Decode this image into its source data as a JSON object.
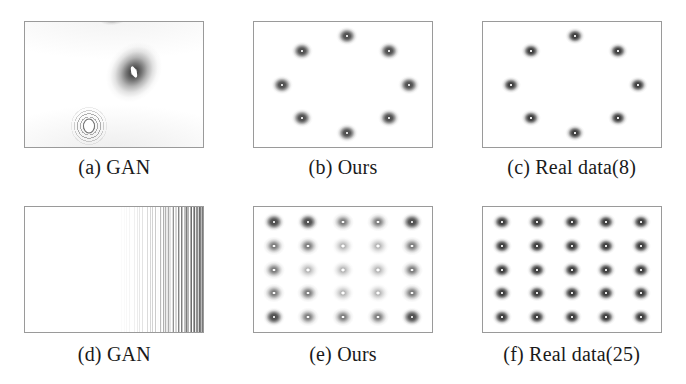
{
  "figure": {
    "type": "subfigure-grid",
    "columns": 3,
    "rows": 2,
    "panels": [
      {
        "id": "a",
        "caption": "(a) GAN",
        "kind": "density-blobs",
        "mode_count": 3,
        "description": "collapsed GAN density with three diffuse blobs",
        "modes": [
          {
            "x": 50,
            "y": -3,
            "style": "blob-top"
          },
          {
            "x": 61,
            "y": 40,
            "style": "blob-main"
          },
          {
            "x": 36,
            "y": 83,
            "style": "blob-rings"
          }
        ]
      },
      {
        "id": "b",
        "caption": "(b) Ours",
        "kind": "ring-8",
        "mode_count": 8,
        "description": "eight recovered modes arranged in a ring",
        "modes": [
          {
            "x": 52,
            "y": 11,
            "style": "soft"
          },
          {
            "x": 76,
            "y": 23,
            "style": "soft"
          },
          {
            "x": 87,
            "y": 50,
            "style": "soft"
          },
          {
            "x": 76,
            "y": 77,
            "style": "soft"
          },
          {
            "x": 52,
            "y": 89,
            "style": "soft"
          },
          {
            "x": 27,
            "y": 77,
            "style": "soft"
          },
          {
            "x": 16,
            "y": 50,
            "style": "soft"
          },
          {
            "x": 27,
            "y": 23,
            "style": "soft"
          }
        ]
      },
      {
        "id": "c",
        "caption": "(c) Real data(8)",
        "kind": "ring-8",
        "mode_count": 8,
        "description": "ground-truth eight-mode ring",
        "modes": [
          {
            "x": 52,
            "y": 11,
            "style": "crisp"
          },
          {
            "x": 76,
            "y": 23,
            "style": "crisp"
          },
          {
            "x": 87,
            "y": 50,
            "style": "crisp"
          },
          {
            "x": 76,
            "y": 77,
            "style": "crisp"
          },
          {
            "x": 52,
            "y": 89,
            "style": "crisp"
          },
          {
            "x": 27,
            "y": 77,
            "style": "crisp"
          },
          {
            "x": 16,
            "y": 50,
            "style": "crisp"
          },
          {
            "x": 27,
            "y": 23,
            "style": "crisp"
          }
        ]
      },
      {
        "id": "d",
        "caption": "(d) GAN",
        "kind": "collapsed-stripes",
        "mode_count": 0,
        "description": "fully collapsed GAN, fine vertical contour striations crowded at the right edge",
        "modes": []
      },
      {
        "id": "e",
        "caption": "(e) Ours",
        "kind": "grid-25",
        "mode_count": 25,
        "description": "twenty-five recovered modes on a five-by-five grid, interior modes fainter",
        "grid": {
          "cols": 5,
          "rows": 5
        },
        "styles": [
          [
            "soft",
            "soft",
            "mid",
            "mid",
            "soft"
          ],
          [
            "mid",
            "mid",
            "faint",
            "faint",
            "mid"
          ],
          [
            "mid",
            "faint",
            "faint",
            "faint",
            "mid"
          ],
          [
            "mid",
            "mid",
            "faint",
            "faint",
            "mid"
          ],
          [
            "soft",
            "mid",
            "mid",
            "mid",
            "soft"
          ]
        ]
      },
      {
        "id": "f",
        "caption": "(f) Real data(25)",
        "kind": "grid-25",
        "mode_count": 25,
        "description": "ground-truth twenty-five-mode grid",
        "grid": {
          "cols": 5,
          "rows": 5
        },
        "styles": [
          [
            "crisp",
            "crisp",
            "crisp",
            "crisp",
            "crisp"
          ],
          [
            "crisp",
            "crisp",
            "crisp",
            "crisp",
            "crisp"
          ],
          [
            "crisp",
            "crisp",
            "crisp",
            "crisp",
            "crisp"
          ],
          [
            "crisp",
            "crisp",
            "crisp",
            "crisp",
            "crisp"
          ],
          [
            "crisp",
            "crisp",
            "crisp",
            "crisp",
            "crisp"
          ]
        ]
      }
    ]
  },
  "colors": {
    "background": "#ffffff",
    "panel_border": "#9a9a9a",
    "mode_dark": "#3a3a3a",
    "caption_text": "#1a1a1a"
  },
  "chart_data": {
    "type": "scatter",
    "title": "",
    "xlabel": "",
    "ylabel": "",
    "grid": false,
    "legend": "none",
    "panels": [
      {
        "id": "a",
        "label": "(a) GAN",
        "modes_shown": 3,
        "modes_expected": 8
      },
      {
        "id": "b",
        "label": "(b) Ours",
        "modes_shown": 8,
        "modes_expected": 8
      },
      {
        "id": "c",
        "label": "(c) Real data(8)",
        "modes_shown": 8,
        "modes_expected": 8
      },
      {
        "id": "d",
        "label": "(d) GAN",
        "modes_shown": 0,
        "modes_expected": 25
      },
      {
        "id": "e",
        "label": "(e) Ours",
        "modes_shown": 25,
        "modes_expected": 25
      },
      {
        "id": "f",
        "label": "(f) Real data(25)",
        "modes_shown": 25,
        "modes_expected": 25
      }
    ]
  }
}
